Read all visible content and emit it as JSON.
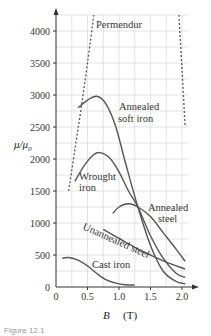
{
  "chart_data": {
    "type": "line",
    "title": "",
    "xlabel": "B (T)",
    "ylabel": "μ/μ0",
    "xlim": [
      0,
      2.1
    ],
    "ylim": [
      0,
      4250
    ],
    "x_ticks": [
      0,
      0.5,
      1.0,
      1.5,
      2.0
    ],
    "x_tick_labels": [
      "0",
      "0.5",
      "1.0",
      "1.5",
      "2.0"
    ],
    "y_ticks": [
      0,
      500,
      1000,
      1500,
      2000,
      2500,
      3000,
      3500,
      4000
    ],
    "y_tick_labels": [
      "0",
      "500",
      "1000",
      "1500",
      "2000",
      "2500",
      "3000",
      "3500",
      "4000"
    ],
    "grid": true,
    "legend": "inline labels",
    "series": [
      {
        "name": "Permendur",
        "style": "dashed",
        "segments": [
          {
            "x": [
              0.2,
              0.3,
              0.4,
              0.5,
              0.6
            ],
            "y": [
              1500,
              2150,
              2800,
              3500,
              4250
            ]
          },
          {
            "x": [
              1.95,
              2.0,
              2.05
            ],
            "y": [
              4250,
              3400,
              2500
            ]
          }
        ]
      },
      {
        "name": "Annealed soft iron",
        "style": "solid",
        "x": [
          0.35,
          0.5,
          0.65,
          0.8,
          0.95,
          1.1,
          1.3,
          1.5,
          1.7,
          1.9,
          2.05
        ],
        "y": [
          2800,
          2920,
          2980,
          2850,
          2500,
          1950,
          1250,
          650,
          250,
          90,
          50
        ]
      },
      {
        "name": "Wrought iron",
        "style": "solid",
        "x": [
          0.3,
          0.45,
          0.6,
          0.7,
          0.85,
          1.0,
          1.15,
          1.3,
          1.5,
          1.7,
          1.9,
          2.05
        ],
        "y": [
          1650,
          1900,
          2070,
          2100,
          2020,
          1800,
          1500,
          1250,
          800,
          450,
          220,
          150
        ]
      },
      {
        "name": "Annealed steel",
        "style": "solid",
        "x": [
          0.9,
          1.0,
          1.15,
          1.3,
          1.5,
          1.7,
          1.9,
          2.05
        ],
        "y": [
          1150,
          1250,
          1300,
          1250,
          1100,
          850,
          600,
          400
        ]
      },
      {
        "name": "Unannealed steel",
        "style": "solid",
        "x": [
          0.75,
          1.0,
          1.25,
          1.5,
          1.75,
          2.05
        ],
        "y": [
          900,
          760,
          620,
          500,
          390,
          280
        ]
      },
      {
        "name": "Cast iron",
        "style": "solid",
        "x": [
          0.1,
          0.2,
          0.35,
          0.5,
          0.65,
          0.8,
          0.95,
          1.1,
          1.25
        ],
        "y": [
          450,
          460,
          420,
          330,
          210,
          110,
          60,
          35,
          30
        ]
      }
    ],
    "annotations": [
      "Permendur",
      "Annealed soft iron",
      "Wrought iron",
      "Annealed steel",
      "Unannealed steel",
      "Cast iron"
    ]
  },
  "labels": {
    "permendur": "Permendur",
    "soft_iron_1": "Annealed",
    "soft_iron_2": "soft iron",
    "wrought_1": "Wrought",
    "wrought_2": "iron",
    "ann_steel_1": "Annealed",
    "ann_steel_2": "steel",
    "unann_steel": "Unannealed steel",
    "cast_iron": "Cast iron",
    "x_title_var": "B",
    "x_title_unit": "(T)",
    "y_title": "μ/μ",
    "y_title_sub": "0",
    "caption": "Figure 12.1"
  }
}
